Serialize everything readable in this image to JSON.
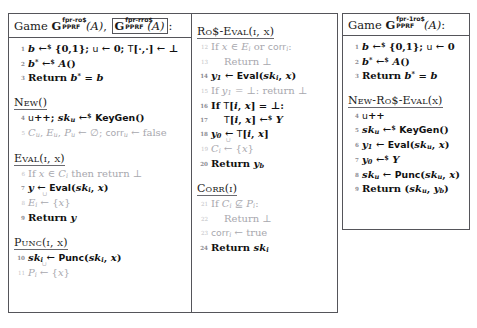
{
  "figure": {
    "kind": "cryptographic-game-pseudocode",
    "boxes": [
      "main",
      "right"
    ]
  },
  "main_box": {
    "left_column": {
      "header": {
        "game_word": "Game",
        "game1_name": "G",
        "game1_sup": "fpr-ro$",
        "game1_sub": "PPRF",
        "game1_arg": "(A)",
        "separator": ",",
        "game2_name": "G",
        "game2_sup": "fpr-rro$",
        "game2_sub": "PPRF",
        "game2_arg": "(A)",
        "colon": ":"
      },
      "lines": [
        {
          "n": "1",
          "text": "b ←$ {0,1}; u ← 0; T[·,·] ← ⊥",
          "style": "strong"
        },
        {
          "n": "2",
          "text": "b* ←$ A()",
          "style": "strong"
        },
        {
          "n": "3",
          "text": "Return b* = b",
          "style": "strong"
        }
      ],
      "procedures": [
        {
          "name": "New()",
          "lines": [
            {
              "n": "4",
              "text": "u++; sk_u ←$ KeyGen()",
              "style": "strong"
            },
            {
              "n": "5",
              "text": "C_u, E_u, P_u ← ∅; corr_u ← false",
              "style": "dim"
            }
          ]
        },
        {
          "name": "Eval(i, x)",
          "lines": [
            {
              "n": "6",
              "text": "If x ∈ C_i then return ⊥",
              "style": "dim"
            },
            {
              "n": "7",
              "text": "y ← Eval(sk_i, x)",
              "style": "strong"
            },
            {
              "n": "8",
              "text": "E_i ←∪ {x}",
              "style": "dim"
            },
            {
              "n": "9",
              "text": "Return y",
              "style": "strong"
            }
          ]
        },
        {
          "name": "Punc(i, x)",
          "lines": [
            {
              "n": "10",
              "text": "sk_i ← Punc(sk_i, x)",
              "style": "strong"
            },
            {
              "n": "11",
              "text": "P_i ←∪ {x}",
              "style": "dim"
            }
          ]
        }
      ]
    },
    "mid_column": {
      "procedures": [
        {
          "name": "Ro$-Eval(i, x)",
          "lines": [
            {
              "n": "12",
              "text": "If x ∈ E_i or corr_i:",
              "style": "dim"
            },
            {
              "n": "13",
              "text": "Return ⊥",
              "style": "dim",
              "indent": true
            },
            {
              "n": "14",
              "text": "y_1 ← Eval(sk_i, x)",
              "style": "strong"
            },
            {
              "n": "15",
              "text": "If y_1 = ⊥: return ⊥",
              "style": "dim"
            },
            {
              "n": "16",
              "text": "If T[i, x] = ⊥:",
              "style": "strong"
            },
            {
              "n": "17",
              "text": "T[i, x] ←$ Y",
              "style": "strong",
              "indent": true
            },
            {
              "n": "18",
              "text": "y_0 ← T[i, x]",
              "style": "strong"
            },
            {
              "n": "19",
              "text": "C_i ←∪ {x}",
              "style": "dim"
            },
            {
              "n": "20",
              "text": "Return y_b",
              "style": "strong"
            }
          ]
        },
        {
          "name": "Corr(i)",
          "lines": [
            {
              "n": "21",
              "text": "If C_i ⊈ P_i:",
              "style": "dim"
            },
            {
              "n": "22",
              "text": "Return ⊥",
              "style": "dim",
              "indent": true
            },
            {
              "n": "23",
              "text": "corr_i ← true",
              "style": "dim"
            },
            {
              "n": "24",
              "text": "Return sk_i",
              "style": "strong"
            }
          ]
        }
      ]
    }
  },
  "right_box": {
    "header": {
      "game_word": "Game",
      "game_name": "G",
      "game_sup": "fpr-1ro$",
      "game_sub": "PPRF",
      "game_arg": "(A)",
      "colon": ":"
    },
    "lines": [
      {
        "n": "1",
        "text": "b ←$ {0,1}; u ← 0",
        "style": "strong"
      },
      {
        "n": "2",
        "text": "b* ←$ A()",
        "style": "strong"
      },
      {
        "n": "3",
        "text": "Return b* = b",
        "style": "strong"
      }
    ],
    "procedures": [
      {
        "name": "New-Ro$-Eval(x)",
        "lines": [
          {
            "n": "4",
            "text": "u++",
            "style": "strong"
          },
          {
            "n": "5",
            "text": "sk_u ←$ KeyGen()",
            "style": "strong"
          },
          {
            "n": "6",
            "text": "y_1 ← Eval(sk_u, x)",
            "style": "strong"
          },
          {
            "n": "7",
            "text": "y_0 ←$ Y",
            "style": "strong"
          },
          {
            "n": "8",
            "text": "sk_u ← Punc(sk_u, x)",
            "style": "strong"
          },
          {
            "n": "9",
            "text": "Return (sk_u, y_b)",
            "style": "strong"
          }
        ]
      }
    ]
  },
  "colors": {
    "border": "#55555a",
    "dim_text": "#a8a8ae",
    "strong_text": "#111111"
  }
}
